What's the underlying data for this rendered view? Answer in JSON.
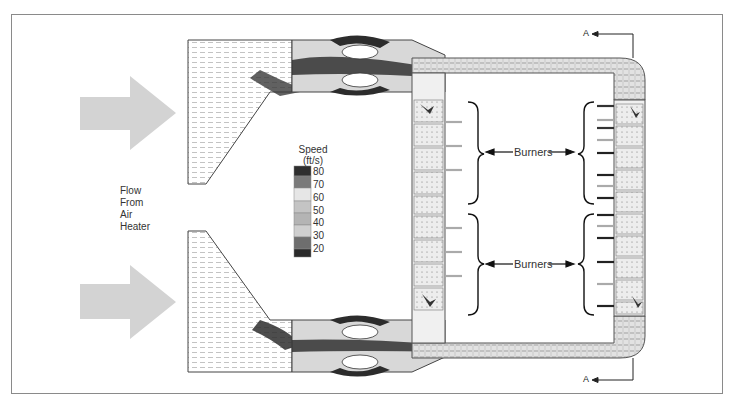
{
  "figure": {
    "inlet_label": [
      "Flow",
      "From",
      "Air",
      "Heater"
    ],
    "legend": {
      "title_line1": "Speed",
      "title_line2": "(ft/s)",
      "ticks": [
        "80",
        "70",
        "60",
        "50",
        "40",
        "30",
        "20"
      ],
      "bands": [
        "#2e2e2e",
        "#7a7a7a",
        "#e6e6e6",
        "#c4c4c4",
        "#b4b4b4",
        "#cfcfcf",
        "#6e6e6e",
        "#2a2a2a"
      ]
    },
    "burner_groups": [
      {
        "label": "Burners"
      },
      {
        "label": "Burners"
      }
    ],
    "section_marker": "A",
    "section_marker_bottom": "A",
    "colors": {
      "arrow_fill": "#d3d3d3",
      "duct_outline": "#444444",
      "frame": "#8a8a8a"
    }
  }
}
